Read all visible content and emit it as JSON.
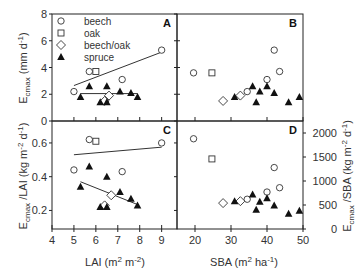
{
  "chart_data": [
    {
      "panel": "A",
      "type": "scatter",
      "xlabel": "LAI (m2 m-2)",
      "ylabel": "Ecmax (mm d-1)",
      "xlim": [
        4,
        9.7
      ],
      "ylim": [
        0,
        8
      ],
      "yticks": [
        0,
        2,
        4,
        6,
        8
      ],
      "xticks": [
        5,
        6,
        7,
        8,
        9
      ],
      "series": [
        {
          "name": "beech",
          "marker": "circle",
          "points": [
            [
              5.0,
              2.2
            ],
            [
              5.7,
              3.7
            ],
            [
              7.2,
              3.1
            ],
            [
              9.0,
              5.3
            ]
          ]
        },
        {
          "name": "oak",
          "marker": "square",
          "points": [
            [
              6.0,
              3.7
            ]
          ]
        },
        {
          "name": "beech/oak",
          "marker": "diamond",
          "points": [
            [
              6.4,
              1.5
            ],
            [
              6.6,
              1.9
            ]
          ]
        },
        {
          "name": "spruce",
          "marker": "triangle",
          "points": [
            [
              5.3,
              1.8
            ],
            [
              5.7,
              2.6
            ],
            [
              6.2,
              1.4
            ],
            [
              6.5,
              2.6
            ],
            [
              6.5,
              1.4
            ],
            [
              7.1,
              2.2
            ],
            [
              7.6,
              2.1
            ],
            [
              7.9,
              1.8
            ]
          ]
        }
      ],
      "fit_lines": [
        {
          "series": "beech",
          "x": [
            5.0,
            9.0
          ],
          "y": [
            2.65,
            5.15
          ]
        },
        {
          "series": "spruce",
          "x": [
            5.3,
            7.9
          ],
          "y": [
            2.05,
            2.05
          ]
        }
      ]
    },
    {
      "panel": "B",
      "type": "scatter",
      "xlabel": "SBA (m2 ha-1)",
      "ylabel": "Ecmax (mm d-1)",
      "xlim": [
        15,
        50
      ],
      "ylim": [
        0,
        8
      ],
      "xticks": [
        20,
        30,
        40,
        50
      ],
      "series": [
        {
          "name": "beech",
          "marker": "circle",
          "points": [
            [
              19.6,
              3.6
            ],
            [
              34.5,
              2.2
            ],
            [
              40.0,
              3.1
            ],
            [
              42.0,
              5.3
            ],
            [
              43.5,
              3.7
            ]
          ]
        },
        {
          "name": "oak",
          "marker": "square",
          "points": [
            [
              24.7,
              3.6
            ]
          ]
        },
        {
          "name": "beech/oak",
          "marker": "diamond",
          "points": [
            [
              27.8,
              1.5
            ],
            [
              32.6,
              1.9
            ]
          ]
        },
        {
          "name": "spruce",
          "marker": "triangle",
          "points": [
            [
              31.0,
              1.8
            ],
            [
              36.0,
              2.6
            ],
            [
              37.0,
              1.4
            ],
            [
              38.0,
              2.2
            ],
            [
              40.0,
              2.6
            ],
            [
              42.0,
              2.1
            ],
            [
              46.0,
              1.4
            ],
            [
              49.0,
              1.8
            ]
          ]
        }
      ]
    },
    {
      "panel": "C",
      "type": "scatter",
      "xlabel": "LAI (m2 m-2)",
      "ylabel": "Ecmax /LAI (kg m-2 d-1)",
      "xlim": [
        4,
        9.7
      ],
      "ylim": [
        0.09,
        0.73
      ],
      "yticks": [
        0.2,
        0.4,
        0.6
      ],
      "xticks": [
        4,
        5,
        6,
        7,
        8,
        9
      ],
      "series": [
        {
          "name": "beech",
          "marker": "circle",
          "points": [
            [
              5.0,
              0.44
            ],
            [
              5.7,
              0.62
            ],
            [
              7.2,
              0.43
            ],
            [
              9.0,
              0.6
            ]
          ]
        },
        {
          "name": "oak",
          "marker": "square",
          "points": [
            [
              6.0,
              0.61
            ]
          ]
        },
        {
          "name": "beech/oak",
          "marker": "diamond",
          "points": [
            [
              6.4,
              0.23
            ],
            [
              6.7,
              0.29
            ]
          ]
        },
        {
          "name": "spruce",
          "marker": "triangle",
          "points": [
            [
              5.3,
              0.34
            ],
            [
              5.7,
              0.46
            ],
            [
              6.2,
              0.22
            ],
            [
              6.5,
              0.4
            ],
            [
              6.5,
              0.22
            ],
            [
              7.1,
              0.31
            ],
            [
              7.6,
              0.27
            ],
            [
              7.9,
              0.23
            ]
          ]
        }
      ],
      "fit_lines": [
        {
          "series": "beech",
          "x": [
            5.0,
            9.0
          ],
          "y": [
            0.53,
            0.575
          ]
        },
        {
          "series": "spruce",
          "x": [
            5.3,
            7.9
          ],
          "y": [
            0.37,
            0.235
          ]
        }
      ]
    },
    {
      "panel": "D",
      "type": "scatter",
      "xlabel": "SBA (m2 ha-1)",
      "ylabel": "Ecmax /SBA (kg m-2 d-1)",
      "xlim": [
        15,
        50
      ],
      "ylim": [
        0,
        2250
      ],
      "yticks": [
        0,
        500,
        1000,
        1500,
        2000
      ],
      "xticks": [
        20,
        30,
        40,
        50
      ],
      "series": [
        {
          "name": "beech",
          "marker": "circle",
          "points": [
            [
              19.6,
              1880
            ],
            [
              34.5,
              620
            ],
            [
              40.0,
              770
            ],
            [
              42.0,
              1280
            ],
            [
              43.5,
              860
            ]
          ]
        },
        {
          "name": "oak",
          "marker": "square",
          "points": [
            [
              24.7,
              1460
            ]
          ]
        },
        {
          "name": "beech/oak",
          "marker": "diamond",
          "points": [
            [
              27.8,
              540
            ],
            [
              32.6,
              580
            ]
          ]
        },
        {
          "name": "spruce",
          "marker": "triangle",
          "points": [
            [
              31.0,
              580
            ],
            [
              36.0,
              720
            ],
            [
              37.0,
              400
            ],
            [
              38.0,
              570
            ],
            [
              40.0,
              640
            ],
            [
              42.0,
              490
            ],
            [
              46.0,
              320
            ],
            [
              49.0,
              380
            ]
          ]
        }
      ]
    }
  ],
  "legend": {
    "placement": "top-left of panel A",
    "entries": [
      {
        "label": "beech",
        "marker": "circle"
      },
      {
        "label": "oak",
        "marker": "square"
      },
      {
        "label": "beech/oak",
        "marker": "diamond"
      },
      {
        "label": "spruce",
        "marker": "triangle"
      }
    ]
  },
  "labels": {
    "panel_a": "A",
    "panel_b": "B",
    "panel_c": "C",
    "panel_d": "D",
    "x_left": "LAI (m",
    "x_left_sup1": "2",
    "x_left_mid": " m",
    "x_left_sup2": "-2",
    "x_left_end": ")",
    "x_right": "SBA (m",
    "x_right_sup1": "2",
    "x_right_mid": " ha",
    "x_right_sup2": "-1",
    "x_right_end": ")",
    "y_top_main": "E",
    "y_top_sub": "cmax",
    "y_top_rest": " (mm d",
    "y_top_sup": "-1",
    "y_top_end": ")",
    "y_bot_main": "E",
    "y_bot_sub": "cmax",
    "y_bot_rest": " /LAI (kg m",
    "y_bot_sup": "-2",
    "y_bot_mid": " d",
    "y_bot_sup2": "-1",
    "y_bot_end": ")",
    "y_right_main": "E",
    "y_right_sub": "cmax",
    "y_right_rest": " /SBA (kg m",
    "y_right_sup": "-2",
    "y_right_mid": " d",
    "y_right_sup2": "-1",
    "y_right_end": ")"
  }
}
